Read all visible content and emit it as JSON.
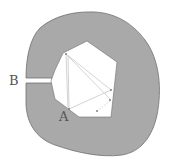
{
  "diagram": {
    "type": "room-with-polygonal-mirror-interior",
    "labels": {
      "point_a": "A",
      "point_b": "B"
    },
    "colors": {
      "outer_fill": "#a9a9a9",
      "outer_stroke": "#6e6e6e",
      "inner_fill": "#ffffff",
      "ray_color": "#c8c8c8",
      "label_color": "#555555"
    }
  }
}
